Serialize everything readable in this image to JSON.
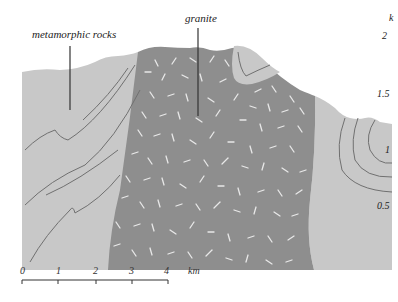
{
  "diagram": {
    "type": "geological cross-section",
    "labels": {
      "metamorphic": "metamorphic rocks",
      "granite": "granite"
    },
    "k_axis": {
      "title": "k",
      "ticks": [
        "2",
        "1.5",
        "1",
        "0.5"
      ]
    },
    "scale_bar": {
      "ticks": [
        "0",
        "1",
        "2",
        "3",
        "4"
      ],
      "unit": "km"
    },
    "colors": {
      "metamorphic_fill": "#c8c8c8",
      "granite_fill": "#8e8e8e",
      "granite_marks": "#e8e8e8",
      "contour_lines": "#707070",
      "leader_lines": "#333333",
      "background": "#ffffff"
    }
  }
}
